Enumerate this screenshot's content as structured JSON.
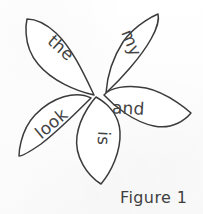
{
  "figure": {
    "caption": "Figure 1",
    "ink_color": "#3b3b3b",
    "text_color": "#434343",
    "background_color": "#fdfdfd"
  },
  "flower": {
    "center": {
      "x": 96,
      "y": 96
    },
    "petal_count": 5,
    "petals": [
      {
        "id": "petal-the",
        "word": "the",
        "position": "upper-left",
        "tip": {
          "x": 27,
          "y": 19
        },
        "text_rotation_deg": 42,
        "text_anchor": {
          "x": 57,
          "y": 52
        }
      },
      {
        "id": "petal-my",
        "word": "my",
        "position": "upper-right",
        "tip": {
          "x": 158,
          "y": 14
        },
        "text_rotation_deg": 68,
        "text_anchor": {
          "x": 126,
          "y": 45
        }
      },
      {
        "id": "petal-and",
        "word": "and",
        "position": "right",
        "tip": {
          "x": 191,
          "y": 113
        },
        "text_rotation_deg": 3,
        "text_anchor": {
          "x": 126,
          "y": 113
        }
      },
      {
        "id": "petal-look",
        "word": "look",
        "position": "left",
        "tip": {
          "x": 19,
          "y": 156
        },
        "text_rotation_deg": -40,
        "text_anchor": {
          "x": 34,
          "y": 136
        }
      },
      {
        "id": "petal-is",
        "word": "is",
        "position": "bottom",
        "text_rotation_deg": 92,
        "tip": {
          "x": 101,
          "y": 184
        },
        "text_anchor": {
          "x": 94,
          "y": 126
        }
      }
    ]
  }
}
